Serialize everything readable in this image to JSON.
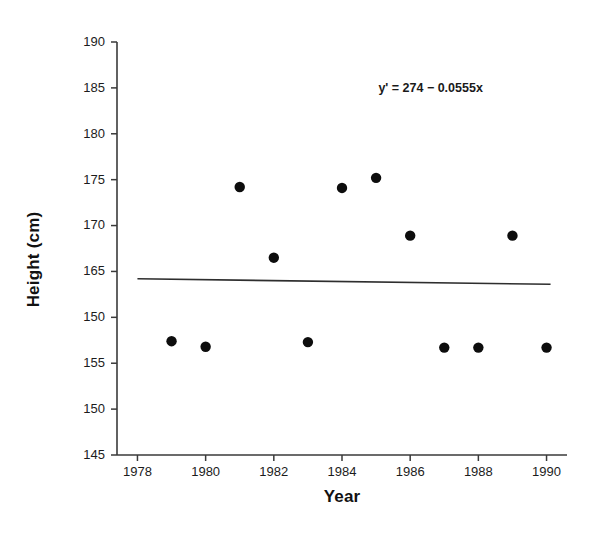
{
  "chart_data": {
    "type": "scatter",
    "title": "",
    "xlabel": "Year",
    "ylabel": "Height (cm)",
    "xlim": [
      1977.4,
      1990.6
    ],
    "ylim": [
      145,
      190
    ],
    "grid": false,
    "legend": null,
    "x_ticks": [
      "1978",
      "1980",
      "1982",
      "1984",
      "1986",
      "1988",
      "1990"
    ],
    "x_tick_values": [
      1978,
      1980,
      1982,
      1984,
      1986,
      1988,
      1990
    ],
    "y_ticks": [
      "190",
      "185",
      "180",
      "175",
      "170",
      "165",
      "150",
      "155",
      "150",
      "145"
    ],
    "y_tick_values": [
      190,
      185,
      180,
      175,
      170,
      165,
      160,
      155,
      150,
      145
    ],
    "x": [
      1979,
      1980,
      1981,
      1982,
      1983,
      1984,
      1985,
      1986,
      1987,
      1988,
      1989,
      1990
    ],
    "y": [
      157.4,
      156.8,
      174.2,
      166.5,
      157.3,
      174.1,
      175.2,
      168.9,
      156.7,
      156.7,
      168.9,
      156.7
    ],
    "points": [
      {
        "x": 1979,
        "y": 157.4
      },
      {
        "x": 1980,
        "y": 156.8
      },
      {
        "x": 1981,
        "y": 174.2
      },
      {
        "x": 1982,
        "y": 166.5
      },
      {
        "x": 1983,
        "y": 157.3
      },
      {
        "x": 1984,
        "y": 174.1
      },
      {
        "x": 1985,
        "y": 175.2
      },
      {
        "x": 1986,
        "y": 168.9
      },
      {
        "x": 1987,
        "y": 156.7
      },
      {
        "x": 1988,
        "y": 156.7
      },
      {
        "x": 1989,
        "y": 168.9
      },
      {
        "x": 1990,
        "y": 156.7
      }
    ],
    "annotations": [
      {
        "name": "regression-equation",
        "text": "y' = 274 − 0.0555x",
        "x": 1986.6,
        "y": 184.5
      }
    ],
    "trendline": {
      "equation": "y' = 274 − 0.0555x",
      "intercept": 274,
      "slope": -0.0555,
      "x_start": 1978,
      "x_end": 1990,
      "y_start": 164.2,
      "y_end": 163.6
    },
    "marker_color": "#0d0d0d",
    "line_color": "#2e2e2e",
    "axis_color": "#3a3a3a",
    "background_color": "#ffffff"
  }
}
